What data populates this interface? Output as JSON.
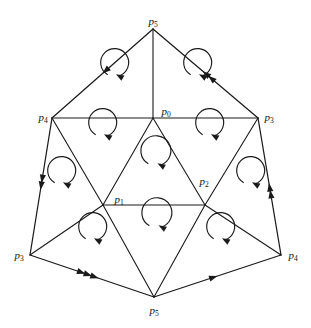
{
  "figure": {
    "stroke_color": "#1a1a1a",
    "background_color": "#ffffff",
    "width": 311,
    "height": 328
  },
  "vertices": [
    {
      "id": "v-top",
      "name": "p",
      "sub": "5",
      "x": 153,
      "y": 29,
      "lx": 153,
      "ly": 22,
      "anchor": "middle"
    },
    {
      "id": "v-left",
      "name": "p",
      "sub": "4",
      "x": 52,
      "y": 118,
      "lx": 43,
      "ly": 118,
      "anchor": "middle"
    },
    {
      "id": "v-right",
      "name": "p",
      "sub": "3",
      "x": 258,
      "y": 118,
      "lx": 269,
      "ly": 118,
      "anchor": "middle"
    },
    {
      "id": "v-bottom-left",
      "name": "p",
      "sub": "3",
      "x": 30,
      "y": 255,
      "lx": 19,
      "ly": 256,
      "anchor": "middle"
    },
    {
      "id": "v-bottom-right",
      "name": "p",
      "sub": "4",
      "x": 281,
      "y": 255,
      "lx": 293,
      "ly": 256,
      "anchor": "middle"
    },
    {
      "id": "v-bottom",
      "name": "p",
      "sub": "5",
      "x": 154,
      "y": 297,
      "lx": 154,
      "ly": 311,
      "anchor": "middle"
    },
    {
      "id": "v-center-top",
      "name": "p",
      "sub": "0",
      "x": 153,
      "y": 118,
      "lx": 166,
      "ly": 112,
      "anchor": "middle"
    },
    {
      "id": "v-center-left",
      "name": "p",
      "sub": "1",
      "x": 103,
      "y": 205,
      "lx": 119,
      "ly": 200,
      "anchor": "middle"
    },
    {
      "id": "v-center-right",
      "name": "p",
      "sub": "2",
      "x": 205,
      "y": 205,
      "lx": 204,
      "ly": 182,
      "anchor": "middle"
    }
  ],
  "boundary_edges": [
    {
      "id": "edge-top-left",
      "from": "v-top",
      "to": "v-left",
      "arrow_count": 1,
      "label": "p5 to p4 upper-left"
    },
    {
      "id": "edge-top-right",
      "from": "v-right",
      "to": "v-top",
      "arrow_count": 2,
      "label": "p3 to p5 upper-right"
    },
    {
      "id": "edge-left",
      "from": "v-left",
      "to": "v-bottom-left",
      "arrow_count": 2,
      "label": "p4 to p3 left"
    },
    {
      "id": "edge-right",
      "from": "v-bottom-right",
      "to": "v-right",
      "arrow_count": 2,
      "label": "p4 to p3 right"
    },
    {
      "id": "edge-bottom-left",
      "from": "v-bottom-left",
      "to": "v-bottom",
      "arrow_count": 3,
      "label": "p3 to p5 bottom-left"
    },
    {
      "id": "edge-bottom-right",
      "from": "v-bottom",
      "to": "v-bottom-right",
      "arrow_count": 1,
      "label": "p5 to p4 bottom-right"
    }
  ],
  "inner_edges": [
    {
      "id": "inner-top-spoke",
      "x1": 153,
      "y1": 29,
      "x2": 153,
      "y2": 118
    },
    {
      "id": "inner-horizontal-mid",
      "x1": 52,
      "y1": 118,
      "x2": 258,
      "y2": 118
    },
    {
      "id": "inner-p0-p1",
      "x1": 153,
      "y1": 118,
      "x2": 103,
      "y2": 205
    },
    {
      "id": "inner-p0-p2",
      "x1": 153,
      "y1": 118,
      "x2": 205,
      "y2": 205
    },
    {
      "id": "inner-p1-p2",
      "x1": 103,
      "y1": 205,
      "x2": 205,
      "y2": 205
    },
    {
      "id": "inner-p4-p1",
      "x1": 52,
      "y1": 118,
      "x2": 103,
      "y2": 205
    },
    {
      "id": "inner-p3-p2",
      "x1": 258,
      "y1": 118,
      "x2": 205,
      "y2": 205
    },
    {
      "id": "inner-bl-p1",
      "x1": 30,
      "y1": 255,
      "x2": 103,
      "y2": 205
    },
    {
      "id": "inner-br-p2",
      "x1": 281,
      "y1": 255,
      "x2": 205,
      "y2": 205
    },
    {
      "id": "inner-p1-bottom",
      "x1": 103,
      "y1": 205,
      "x2": 154,
      "y2": 297
    },
    {
      "id": "inner-p2-bottom",
      "x1": 205,
      "y1": 205,
      "x2": 154,
      "y2": 297
    }
  ],
  "orientation_circles": [
    {
      "id": "orient-upper-left-a",
      "cx": 112,
      "cy": 88,
      "r": 14,
      "direction": "counter-clockwise"
    },
    {
      "id": "orient-upper-right-a",
      "cx": 195,
      "cy": 88,
      "r": 14,
      "direction": "counter-clockwise"
    },
    {
      "id": "orient-mid-left",
      "cx": 100,
      "cy": 148,
      "r": 14,
      "direction": "counter-clockwise"
    },
    {
      "id": "orient-mid-center",
      "cx": 153,
      "cy": 178,
      "r": 15,
      "direction": "counter-clockwise"
    },
    {
      "id": "orient-mid-right",
      "cx": 207,
      "cy": 148,
      "r": 14,
      "direction": "counter-clockwise"
    },
    {
      "id": "orient-left-outer",
      "cx": 59,
      "cy": 196,
      "r": 14,
      "direction": "counter-clockwise"
    },
    {
      "id": "orient-right-outer",
      "cx": 248,
      "cy": 196,
      "r": 14,
      "direction": "counter-clockwise"
    },
    {
      "id": "orient-lower-left",
      "cx": 90,
      "cy": 252,
      "r": 14,
      "direction": "counter-clockwise"
    },
    {
      "id": "orient-lower-center",
      "cx": 154,
      "cy": 240,
      "r": 15,
      "direction": "counter-clockwise"
    },
    {
      "id": "orient-lower-right",
      "cx": 218,
      "cy": 252,
      "r": 14,
      "direction": "counter-clockwise"
    }
  ]
}
